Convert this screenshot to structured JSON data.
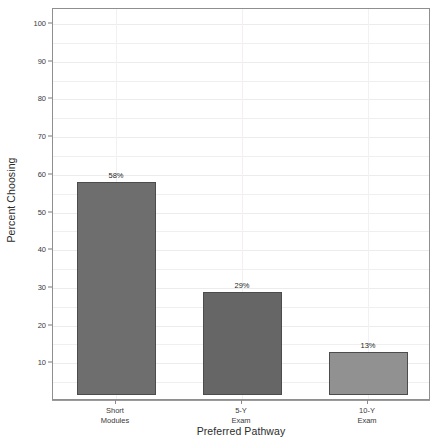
{
  "chart_data": {
    "type": "bar",
    "title": "",
    "subtitle": "",
    "xlabel": "Preferred Pathway",
    "ylabel": "Percent Choosing",
    "categories": [
      "Short Modules",
      "5-Y Exam",
      "10-Y Exam"
    ],
    "category_lines": [
      [
        "Short",
        "Modules"
      ],
      [
        "5-Y",
        "Exam"
      ],
      [
        "10-Y",
        "Exam"
      ]
    ],
    "values": [
      58,
      29,
      13
    ],
    "data_labels": [
      "58%",
      "29%",
      "13%"
    ],
    "bar_colors": [
      "#6e6e6e",
      "#666666",
      "#919191"
    ],
    "bar_border_color": "#4c4c4c",
    "ylim": [
      0,
      104
    ],
    "y_ticks": [
      10,
      20,
      30,
      40,
      50,
      60,
      70,
      80,
      90,
      100
    ],
    "y_tick_labels": [
      "10",
      "20",
      "30",
      "40",
      "50",
      "60",
      "70",
      "80",
      "90",
      "100"
    ],
    "y_minor_ticks": [
      5,
      15,
      25,
      35,
      45,
      55,
      65,
      75,
      85,
      95
    ],
    "grid": true,
    "grid_orientation": "both",
    "legend": false,
    "legend_position": "none",
    "bar_baseline": 1.5
  },
  "axes": {
    "y_title": "Percent Choosing",
    "x_title": "Preferred Pathway"
  }
}
